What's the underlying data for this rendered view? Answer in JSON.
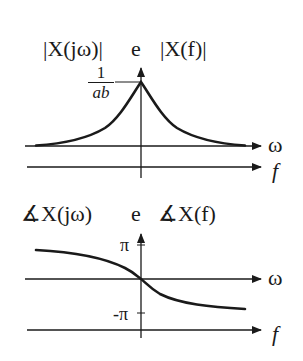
{
  "magnitude_plot": {
    "title_left": "|X(jω)|",
    "title_connector": "e",
    "title_right": "|X(f)|",
    "peak_label_numerator": "1",
    "peak_label_denominator": "ab",
    "x_axis_omega_label": "ω",
    "x_axis_f_label": "f"
  },
  "phase_plot": {
    "title_left": "∡X(jω)",
    "title_connector": "e",
    "title_right": "∡X(f)",
    "tick_pi_label": "π",
    "tick_neg_pi_label": "-π",
    "x_axis_omega_label": "ω",
    "x_axis_f_label": "f"
  },
  "colors": {
    "ink": "#1a1a1a",
    "background": "#ffffff"
  }
}
